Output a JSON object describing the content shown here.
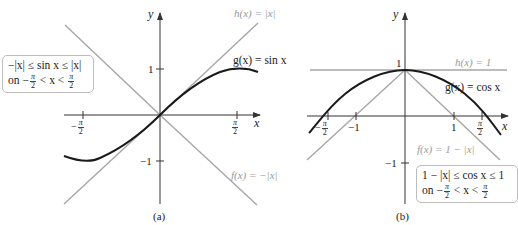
{
  "figure_a": {
    "caption": "(a)",
    "axis_x_label": "x",
    "axis_y_label": "y",
    "ticks": {
      "y_pos": "1",
      "y_neg": "−1",
      "x_pos_num": "π",
      "x_pos_den": "2",
      "x_neg_prefix": "−",
      "x_neg_num": "π",
      "x_neg_den": "2"
    },
    "curves": {
      "h_label": "h(x) = |x|",
      "g_label": "g(x) = sin x",
      "f_label": "f(x) = −|x|"
    },
    "note": {
      "line1": "−|x| ≤ sin x ≤ |x|",
      "line2_prefix": "on −",
      "frac_num": "π",
      "frac_den": "2",
      "line2_mid": " < x < ",
      "frac2_num": "π",
      "frac2_den": "2"
    }
  },
  "figure_b": {
    "caption": "(b)",
    "axis_x_label": "x",
    "axis_y_label": "y",
    "ticks": {
      "y_pos": "1",
      "y_neg": "−1",
      "x_one": "1",
      "x_neg_one": "−1",
      "x_pos_num": "π",
      "x_pos_den": "2",
      "x_neg_prefix": "−",
      "x_neg_num": "π",
      "x_neg_den": "2"
    },
    "curves": {
      "h_label": "h(x) = 1",
      "g_label": "g(x) = cos x",
      "f_label": "f(x) = 1 − |x|"
    },
    "note": {
      "line1": "1 − |x| ≤ cos x ≤ 1",
      "line2_prefix": "on −",
      "frac_num": "π",
      "frac_den": "2",
      "line2_mid": " < x < ",
      "frac2_num": "π",
      "frac2_den": "2"
    }
  },
  "colors": {
    "axis": "#333333",
    "curve_main": "#1a1a1a",
    "curve_bound": "#a6a6a6",
    "label_gray": "#9a9a9a"
  }
}
